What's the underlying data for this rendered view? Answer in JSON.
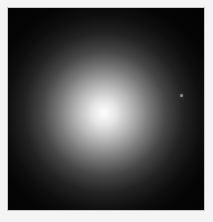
{
  "image": {
    "description": "Grayscale astronomical image of a diffuse, roughly circular glowing object (elliptical galaxy) on a black background with a light border",
    "colors": {
      "border": "#f4f4f4",
      "background": "#030303",
      "core": "#ffffff"
    },
    "object": {
      "center_x": 105,
      "center_y": 110
    },
    "star": {
      "x": 181,
      "y": 95
    }
  }
}
